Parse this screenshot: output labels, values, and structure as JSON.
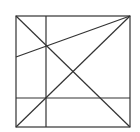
{
  "diagram": {
    "stroke_color": "#333333",
    "background": "#ffffff",
    "square": {
      "x": 16,
      "y": 16,
      "size": 114
    },
    "lines": [
      {
        "name": "diagonal-top-left-to-bottom-right",
        "x1": 16,
        "y1": 16,
        "x2": 130,
        "y2": 127
      },
      {
        "name": "diagonal-bottom-left-to-top-right",
        "x1": 16,
        "y1": 127,
        "x2": 130,
        "y2": 16
      },
      {
        "name": "line-left-edge-to-top-right",
        "x1": 16,
        "y1": 57,
        "x2": 130,
        "y2": 16
      },
      {
        "name": "vertical-line",
        "x1": 46,
        "y1": 16,
        "x2": 46,
        "y2": 127
      },
      {
        "name": "horizontal-line",
        "x1": 16,
        "y1": 98,
        "x2": 130,
        "y2": 98
      }
    ]
  }
}
